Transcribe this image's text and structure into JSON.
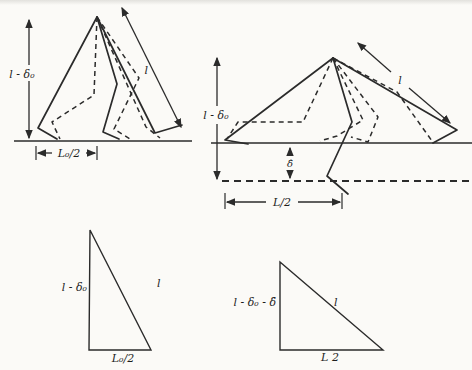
{
  "figure": {
    "top_left": {
      "height_label": "l - δ₀",
      "leg_length_label": "l",
      "base_dimension_label": "L₀/2"
    },
    "top_right": {
      "height_label": "l - δ₀",
      "leg_length_label": "l",
      "squat_depth_label": "δ̂",
      "base_dimension_label": "L/2"
    },
    "bottom_left_triangle": {
      "vertical_side_label": "l - δ₀",
      "hypotenuse_label": "l",
      "base_label": "L₀/2"
    },
    "bottom_right_triangle": {
      "vertical_side_label": "l - δ₀ - δ̂",
      "hypotenuse_label": "l",
      "base_label": "L 2"
    },
    "line_color": "#2b2b2b",
    "paper_color": "#fbfaf7"
  }
}
